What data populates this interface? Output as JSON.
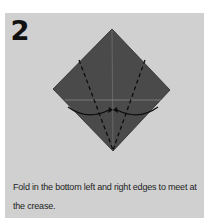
{
  "step": {
    "number": "2",
    "instruction_line1": "Fold in the bottom left and right edges to meet at",
    "instruction_line2": "the crease."
  },
  "colors": {
    "panel_background": "#d0d0d0",
    "paper_fill": "#4a4a4a",
    "fold_lines": "#0d0d0d",
    "crease_lines": "#9a9a9a"
  }
}
